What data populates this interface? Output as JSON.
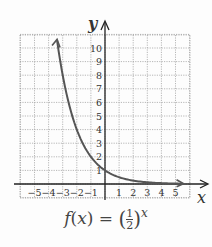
{
  "chart_data": {
    "type": "line",
    "title": "",
    "function_label": "f(x) = (1/2)^x",
    "xlabel": "x",
    "ylabel": "y",
    "xlim": [
      -6,
      6
    ],
    "ylim": [
      -1,
      11
    ],
    "x_ticks": [
      -5,
      -4,
      -3,
      -2,
      -1,
      1,
      2,
      3,
      4,
      5
    ],
    "y_ticks": [
      1,
      2,
      3,
      4,
      5,
      6,
      7,
      8,
      9,
      10
    ],
    "grid": true,
    "series": [
      {
        "name": "f(x) = (1/2)^x",
        "color": "#555555",
        "x": [
          -3.4,
          -3,
          -2,
          -1,
          0,
          1,
          2,
          3,
          4,
          5.5
        ],
        "y": [
          10.56,
          8,
          4,
          2,
          1,
          0.5,
          0.25,
          0.125,
          0.0625,
          0.022
        ]
      }
    ],
    "annotations": [
      "arrow at upper-left end of curve",
      "arrow at right end of curve"
    ]
  },
  "labels": {
    "x_axis": "x",
    "y_axis": "y",
    "formula_prefix": "f(x) = ",
    "formula_num": "1",
    "formula_den": "2",
    "formula_exp": "x"
  }
}
